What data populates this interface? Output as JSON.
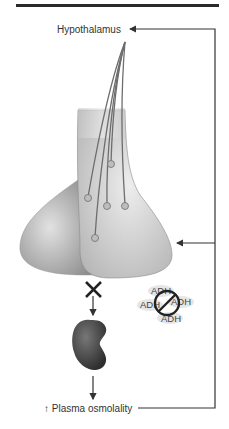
{
  "diagram": {
    "title_rule": true,
    "labels": {
      "hypothalamus": "Hypothalamus",
      "plasma_osmolality": "↑ Plasma osmolality"
    },
    "adh_molecules": [
      "ADH",
      "ADH",
      "ADH",
      "ADH"
    ],
    "symbols": {
      "blocked_release": "x-mark",
      "no_adh": "prohibition-sign"
    },
    "nodes": [
      "Hypothalamus",
      "Posterior pituitary",
      "Kidney",
      "Plasma osmolality"
    ],
    "edges": [
      {
        "from": "Plasma osmolality",
        "to": "Hypothalamus",
        "type": "feedback"
      },
      {
        "from": "Plasma osmolality",
        "to": "Posterior pituitary",
        "type": "feedback"
      },
      {
        "from": "Posterior pituitary",
        "to": "Kidney",
        "type": "blocked"
      },
      {
        "from": "Kidney",
        "to": "Plasma osmolality",
        "type": "arrow"
      }
    ],
    "colors": {
      "line": "#333333",
      "gland_light": "#d9d9d9",
      "gland_dark": "#9a9a9a",
      "kidney": "#4a4a4a"
    }
  }
}
